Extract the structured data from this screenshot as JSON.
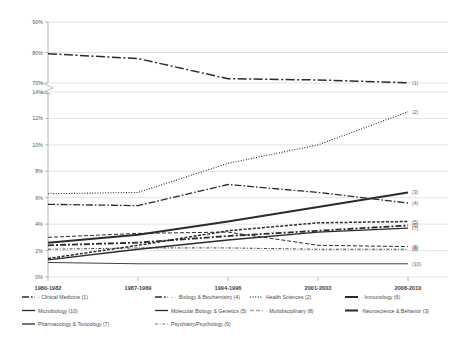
{
  "chart_data": {
    "type": "line",
    "title": "",
    "xlabel": "",
    "ylabel": "",
    "categories": [
      "1980-1982",
      "1987-1989",
      "1994-1996",
      "2001-2003",
      "2008-2010"
    ],
    "grid": true,
    "legend_position": "bottom",
    "broken_axis": true,
    "upper_panel": {
      "ylim": [
        70,
        90
      ],
      "ticks": [
        "90%",
        "80%",
        "70%"
      ],
      "tick_values": [
        90,
        80,
        70
      ]
    },
    "lower_panel": {
      "ylim": [
        0,
        14
      ],
      "ticks": [
        "14%",
        "12%",
        "10%",
        "8%",
        "6%",
        "4%",
        "2%",
        "0%"
      ],
      "tick_values": [
        14,
        12,
        10,
        8,
        6,
        4,
        2,
        0
      ]
    },
    "series": [
      {
        "name": "Clinical Medicine (1)",
        "key": "1",
        "panel": "upper",
        "dash": "long-dashdot",
        "values": [
          79.6,
          78.0,
          71.4,
          71.0,
          70.1
        ]
      },
      {
        "name": "Health Sciences (2)",
        "key": "2",
        "panel": "lower",
        "dash": "dotted",
        "values": [
          6.3,
          6.4,
          8.6,
          10.0,
          12.5
        ]
      },
      {
        "name": "Neuroscience & Behavior (3)",
        "key": "3",
        "panel": "lower",
        "dash": "solid-thick",
        "values": [
          2.6,
          3.2,
          4.2,
          5.3,
          6.4
        ]
      },
      {
        "name": "Biology & Biochemistry (4)",
        "key": "4",
        "panel": "lower",
        "dash": "dashdot",
        "values": [
          5.5,
          5.4,
          7.0,
          6.4,
          5.6
        ]
      },
      {
        "name": "Molecular Biology & Genetics (5)",
        "key": "5",
        "panel": "lower",
        "dash": "dashed-short",
        "values": [
          1.4,
          2.4,
          3.5,
          4.1,
          4.2
        ]
      },
      {
        "name": "Immunology (6)",
        "key": "6",
        "panel": "lower",
        "dash": "dashdot-heavy",
        "values": [
          2.4,
          2.6,
          3.1,
          3.5,
          3.9
        ]
      },
      {
        "name": "Pharmacology & Toxicology (7)",
        "key": "7",
        "panel": "lower",
        "dash": "solid",
        "values": [
          1.3,
          2.1,
          2.8,
          3.4,
          3.7
        ]
      },
      {
        "name": "Multidisciplinary (8)",
        "key": "8",
        "panel": "lower",
        "dash": "grey-dash",
        "values": [
          3.0,
          3.3,
          3.4,
          2.4,
          2.3
        ]
      },
      {
        "name": "Psychiatry/Psychology (9)",
        "key": "9",
        "panel": "lower",
        "dash": "grey-dashdot",
        "values": [
          2.1,
          2.2,
          2.2,
          2.1,
          2.1
        ]
      },
      {
        "name": "Microbiology (10)",
        "key": "10",
        "panel": "lower",
        "dash": "thin-grey",
        "values": [
          1.1,
          1.0,
          1.0,
          1.0,
          1.0
        ]
      }
    ]
  },
  "axis": {
    "upper_ticks": [
      "90%",
      "80%",
      "70%"
    ],
    "lower_ticks": [
      "14%",
      "12%",
      "10%",
      "8%",
      "6%",
      "4%",
      "2%",
      "0%"
    ],
    "x_ticks": [
      "1980-1982",
      "1987-1989",
      "1994-1996",
      "2001-2003",
      "2008-2010"
    ]
  },
  "end_labels": [
    "(1)",
    "(2)",
    "(3)",
    "(4)",
    "(5)",
    "(6)",
    "(7)",
    "(8)",
    "(9)",
    "(10)"
  ],
  "legend": {
    "items": [
      {
        "label": "- Clinical Medicine (1)",
        "style": "dashdot"
      },
      {
        "label": "- · ·Biology & Biochemistry (4)",
        "style": "dashdot"
      },
      {
        "label": "Health Sciences (2)",
        "style": "dotted"
      },
      {
        "label": "· Immunology (6)",
        "style": "solid-thick"
      },
      {
        "label": "Microbiology (10)",
        "style": "thin"
      },
      {
        "label": "Molecular Biology & Genetics (5)",
        "style": "dashed"
      },
      {
        "label": "· Multidisciplinary (8)",
        "style": "grey-dash"
      },
      {
        "label": "·Neuroscience & Behavior (3)",
        "style": "solid-thick"
      },
      {
        "label": "Pharmacology & Toxicology (7)",
        "style": "solid"
      },
      {
        "label": "Psychiatry/Psychology (9)",
        "style": "grey-dashdot"
      }
    ]
  },
  "colors": {
    "line": "#2b2b2b",
    "grey_line": "#a8a8a8",
    "grid": "#d2d2d2",
    "axis": "#9a9a9a",
    "text": "#4a4a4a"
  }
}
